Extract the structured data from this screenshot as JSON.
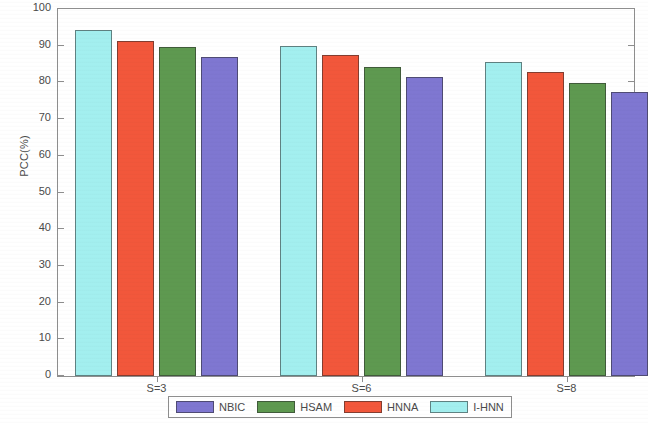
{
  "chart_data": {
    "type": "bar",
    "title": "",
    "xlabel": "",
    "ylabel": "PCC(%)",
    "categories": [
      "S=3",
      "S=6",
      "S=8"
    ],
    "ylim": [
      0,
      100
    ],
    "yticks": [
      0,
      10,
      20,
      30,
      40,
      50,
      60,
      70,
      80,
      90,
      100
    ],
    "grid": false,
    "legend_position": "bottom-center",
    "bar_draw_order": [
      "I-HNN",
      "HNNA",
      "HSAM",
      "NBIC"
    ],
    "series": [
      {
        "name": "NBIC",
        "color": "#7f77d1",
        "values": [
          87.0,
          81.5,
          77.5
        ]
      },
      {
        "name": "HSAM",
        "color": "#5e9950",
        "values": [
          89.6,
          84.3,
          79.9
        ]
      },
      {
        "name": "HNNA",
        "color": "#f2573b",
        "values": [
          91.2,
          87.4,
          82.9
        ]
      },
      {
        "name": "I-HNN",
        "color": "#a3efef",
        "values": [
          94.2,
          90.0,
          85.5
        ]
      }
    ]
  },
  "axes": {
    "y_title": "PCC(%)",
    "y_tick_labels": [
      "0",
      "10",
      "20",
      "30",
      "40",
      "50",
      "60",
      "70",
      "80",
      "90",
      "100"
    ],
    "x_tick_labels": [
      "S=3",
      "S=6",
      "S=8"
    ]
  },
  "legend": {
    "entries": [
      {
        "label": "NBIC",
        "color": "#7f77d1"
      },
      {
        "label": "HSAM",
        "color": "#5e9950"
      },
      {
        "label": "HNNA",
        "color": "#f2573b"
      },
      {
        "label": "I-HNN",
        "color": "#a3efef"
      }
    ]
  }
}
